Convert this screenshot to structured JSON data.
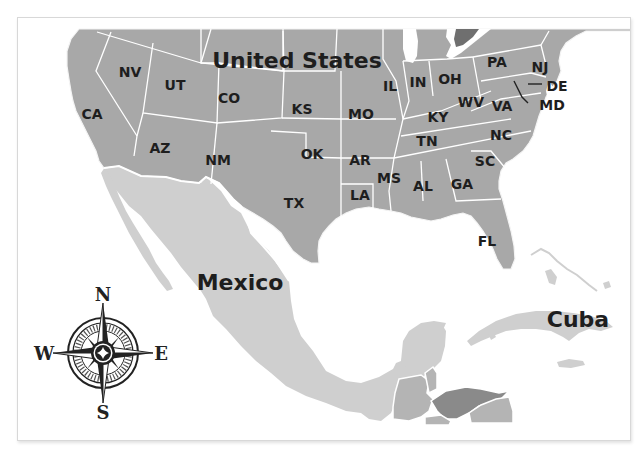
{
  "map": {
    "title": "United States, Mexico and Cuba map",
    "colors": {
      "united_states": "#a8a8a8",
      "mexico": "#cfcfcf",
      "cuba": "#cfcfcf",
      "central_america_medium": "#b4b4b4",
      "central_america_dark": "#8a8a8a",
      "water": "#ffffff",
      "borders": "#ffffff",
      "labels": "#1e1e1e"
    },
    "country_labels": {
      "united_states": "United States",
      "mexico": "Mexico",
      "cuba": "Cuba"
    },
    "state_labels": {
      "NV": "NV",
      "UT": "UT",
      "CA": "CA",
      "CO": "CO",
      "KS": "KS",
      "AZ": "AZ",
      "NM": "NM",
      "OK": "OK",
      "TX": "TX",
      "IL": "IL",
      "IN": "IN",
      "OH": "OH",
      "PA": "PA",
      "NJ": "NJ",
      "DE": "DE",
      "MD": "MD",
      "WV": "WV",
      "VA": "VA",
      "KY": "KY",
      "MO": "MO",
      "AR": "AR",
      "TN": "TN",
      "NC": "NC",
      "SC": "SC",
      "MS": "MS",
      "AL": "AL",
      "GA": "GA",
      "LA": "LA",
      "FL": "FL"
    },
    "compass": {
      "north": "N",
      "south": "S",
      "east": "E",
      "west": "W"
    }
  }
}
